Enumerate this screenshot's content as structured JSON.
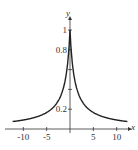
{
  "chart_data": {
    "type": "line",
    "title": "",
    "xlabel": "x",
    "ylabel": "y",
    "xlim": [
      -12.5,
      12.5
    ],
    "ylim": [
      0,
      1.05
    ],
    "xticks": [
      -10,
      -5,
      5,
      10
    ],
    "xtick_labels": [
      "-10",
      "-5",
      "5",
      "10"
    ],
    "yticks": [
      0.2,
      0.4,
      0.6,
      0.8,
      1
    ],
    "ytick_labels": [
      "0.2",
      "0.8",
      "1"
    ],
    "grid": false,
    "series": [
      {
        "name": "y = 1/(1+|x|)",
        "x": [
          -12,
          -10,
          -8,
          -6,
          -5,
          -4,
          -3,
          -2,
          -1,
          -0.5,
          0,
          0.5,
          1,
          2,
          3,
          4,
          5,
          6,
          8,
          10,
          12
        ],
        "values": [
          0.077,
          0.091,
          0.111,
          0.143,
          0.167,
          0.2,
          0.25,
          0.333,
          0.5,
          0.667,
          1,
          0.667,
          0.5,
          0.333,
          0.25,
          0.2,
          0.167,
          0.143,
          0.111,
          0.091,
          0.077
        ]
      }
    ]
  }
}
